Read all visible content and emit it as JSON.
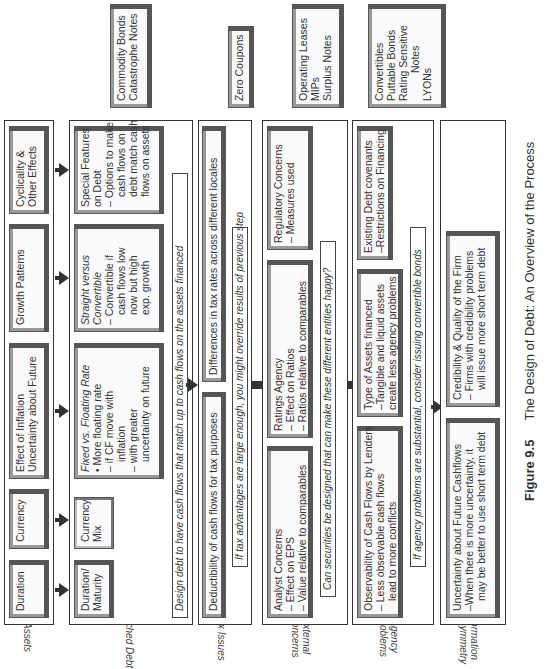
{
  "rows": {
    "assets": {
      "label": "Assets",
      "boxes": [
        {
          "lines": [
            "Duration"
          ]
        },
        {
          "lines": [
            "Currency"
          ]
        },
        {
          "lines": [
            "Effect of Inflation",
            "Uncertainty about Future"
          ]
        },
        {
          "lines": [
            "Growth Patterns"
          ]
        },
        {
          "lines": [
            "Cyclicality &",
            "Other Effects"
          ]
        }
      ]
    },
    "matched_debt": {
      "label": "Matched Debt",
      "boxes": [
        {
          "lines": [
            "Duration/",
            "Maturity"
          ]
        },
        {
          "lines": [
            "Currency",
            "Mix"
          ]
        },
        {
          "title": "Fixed vs. Floating Rate",
          "lines": [
            "• More floating rate",
            "– if CF move with",
            "inflation",
            "– with greater",
            "uncertainty on future"
          ]
        },
        {
          "title": "Straight versus Convertible",
          "lines": [
            "– Convertible if",
            "cash flows low",
            "now but high",
            "exp. growth"
          ]
        },
        {
          "lines": [
            "Special Features",
            "on Debt",
            "– Options to make",
            "cash flows on",
            "debt match cash",
            "flows on assets"
          ]
        }
      ],
      "note": "Design debt to have cash flows that match up to cash flows on the assets financed"
    },
    "tax_issues": {
      "label": "Tax Issues",
      "boxes": [
        {
          "lines": [
            "Deductibility of cash flows for tax purposes"
          ]
        },
        {
          "lines": [
            "Differences in tax rates across different locales"
          ]
        }
      ],
      "note": "If tax advantages are large enough, you might override results of previous step"
    },
    "external_concerns": {
      "label_lines": [
        "External",
        "Concerns"
      ],
      "boxes": [
        {
          "lines": [
            "Analyst Concerns",
            "– Effect on EPS",
            "– Value relative to comparables"
          ]
        },
        {
          "lines": [
            "Ratings Agency",
            "– Effect on Ratios",
            "– Ratios relative to comparables"
          ]
        },
        {
          "lines": [
            "Regulatory Concerns",
            "– Measures used"
          ]
        }
      ],
      "note": "Can securities be designed that can make these different entities happy?"
    },
    "agency_problems": {
      "label_lines": [
        "Agency",
        "Problems"
      ],
      "boxes": [
        {
          "lines": [
            "Observability of Cash Flows by Lenders",
            "– Less observable cash flows",
            "lead to more conflicts"
          ]
        },
        {
          "lines": [
            "Type of Assets financed",
            "–Tangible and liquid assets",
            "create less agency problems"
          ]
        },
        {
          "lines": [
            "Existing Debt covenants",
            "–Restrictions on Financing"
          ]
        }
      ],
      "note": "If agency problems are substantial, consider issuing convertible bonds"
    },
    "information_asymmetry": {
      "label_lines": [
        "Information",
        "Assymmetry"
      ],
      "boxes": [
        {
          "lines": [
            "Uncertainty about Future Cashflows",
            "–When there is more uncertainty, it",
            "may be better to use short term debt"
          ]
        },
        {
          "lines": [
            "Credibility & Quality of the Firm",
            "– Firms with credibility problems",
            "will issue more short term debt"
          ]
        }
      ]
    }
  },
  "securities": [
    {
      "lines": [
        "Commodity Bonds",
        "Catastrophe Notes"
      ]
    },
    {
      "lines": [
        "Zero Coupons"
      ]
    },
    {
      "lines": [
        "Operating Leases",
        "MIPs",
        "Surplus Notes"
      ]
    },
    {
      "lines": [
        "Convertibles",
        "Puttable Bonds",
        "Rating Sensitive",
        "Notes",
        "LYONs"
      ]
    }
  ],
  "caption": {
    "number": "Figure 9.5",
    "title": "The Design of Debt: An Overview of the Process"
  }
}
